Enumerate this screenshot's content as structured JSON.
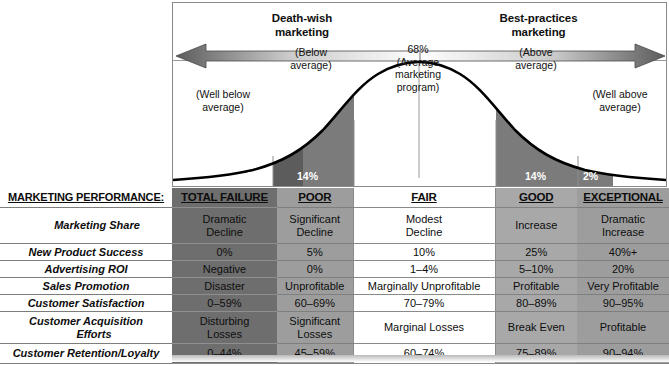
{
  "chart": {
    "band_left_title": "Death-wish\nmarketing",
    "band_left_title_l1": "Death-wish",
    "band_left_title_l2": "marketing",
    "band_right_title_l1": "Best-practices",
    "band_right_title_l2": "marketing",
    "arrow_name": "double-headed-arrow",
    "captions": {
      "well_below_l1": "(Well below",
      "well_below_l2": "average)",
      "below_l1": "(Below",
      "below_l2": "average)",
      "center_l1": "68%",
      "center_l2": "(Average",
      "center_l3": "marketing",
      "center_l4": "program)",
      "above_l1": "(Above",
      "above_l2": "average)",
      "well_above_l1": "(Well above",
      "well_above_l2": "average)"
    },
    "percent_labels": {
      "far_left": "2%",
      "left": "14%",
      "right": "14%",
      "far_right": "2%"
    },
    "colors": {
      "band_dark": "#6e6e6e",
      "band_mid": "#9d9d9d",
      "curve_stroke": "#000000",
      "chart_border": "#8a8a8a"
    }
  },
  "chart_data": {
    "type": "area",
    "xlabel": "",
    "ylabel": "",
    "categories": [
      "TOTAL FAILURE",
      "POOR",
      "FAIR",
      "GOOD",
      "EXCEPTIONAL"
    ],
    "values": [
      2,
      14,
      68,
      14,
      2
    ],
    "value_labels": [
      "2%",
      "14%",
      "68%",
      "14%",
      "2%"
    ],
    "segment_captions": [
      "(Well below average)",
      "(Below average)",
      "(Average marketing program)",
      "(Above average)",
      "(Well above average)"
    ],
    "annotations": [
      "Death-wish marketing",
      "Best-practices marketing"
    ],
    "grid": false,
    "legend": "none",
    "ylim": [
      0,
      100
    ]
  },
  "table": {
    "columns": [
      "MARKETING PERFORMANCE:",
      "TOTAL FAILURE",
      "POOR",
      "FAIR",
      "GOOD",
      "EXCEPTIONAL"
    ],
    "rows": [
      {
        "label": "Marketing Share",
        "indent": true,
        "cells": [
          {
            "l1": "Dramatic",
            "l2": "Decline"
          },
          {
            "l1": "Significant",
            "l2": "Decline"
          },
          {
            "l1": "Modest",
            "l2": "Decline"
          },
          {
            "l1": "Increase",
            "l2": ""
          },
          {
            "l1": "Dramatic",
            "l2": "Increase"
          }
        ]
      },
      {
        "label": "New Product Success",
        "indent": false,
        "cells": [
          {
            "l1": "0%",
            "l2": ""
          },
          {
            "l1": "5%",
            "l2": ""
          },
          {
            "l1": "10%",
            "l2": ""
          },
          {
            "l1": "25%",
            "l2": ""
          },
          {
            "l1": "40%+",
            "l2": ""
          }
        ]
      },
      {
        "label": "Advertising ROI",
        "indent": false,
        "cells": [
          {
            "l1": "Negative",
            "l2": ""
          },
          {
            "l1": "0%",
            "l2": ""
          },
          {
            "l1": "1–4%",
            "l2": ""
          },
          {
            "l1": "5–10%",
            "l2": ""
          },
          {
            "l1": "20%",
            "l2": ""
          }
        ]
      },
      {
        "label": "Sales Promotion",
        "indent": false,
        "cells": [
          {
            "l1": "Disaster",
            "l2": ""
          },
          {
            "l1": "Unprofitable",
            "l2": ""
          },
          {
            "l1": "Marginally Unprofitable",
            "l2": ""
          },
          {
            "l1": "Profitable",
            "l2": ""
          },
          {
            "l1": "Very Profitable",
            "l2": ""
          }
        ]
      },
      {
        "label": "Customer Satisfaction",
        "indent": false,
        "cells": [
          {
            "l1": "0–59%",
            "l2": ""
          },
          {
            "l1": "60–69%",
            "l2": ""
          },
          {
            "l1": "70–79%",
            "l2": ""
          },
          {
            "l1": "80–89%",
            "l2": ""
          },
          {
            "l1": "90–95%",
            "l2": ""
          }
        ]
      },
      {
        "label": "Customer Acquisition",
        "label2": "Efforts",
        "indent": false,
        "cells": [
          {
            "l1": "Disturbing",
            "l2": "Losses"
          },
          {
            "l1": "Significant",
            "l2": "Losses"
          },
          {
            "l1": "Marginal Losses",
            "l2": ""
          },
          {
            "l1": "Break Even",
            "l2": ""
          },
          {
            "l1": "Profitable",
            "l2": ""
          }
        ]
      },
      {
        "label": "Customer Retention/Loyalty",
        "indent": false,
        "cells": [
          {
            "l1": "0–44%",
            "l2": ""
          },
          {
            "l1": "45–59%",
            "l2": ""
          },
          {
            "l1": "60–74%",
            "l2": ""
          },
          {
            "l1": "75–89%",
            "l2": ""
          },
          {
            "l1": "90–94%",
            "l2": ""
          }
        ]
      }
    ]
  }
}
